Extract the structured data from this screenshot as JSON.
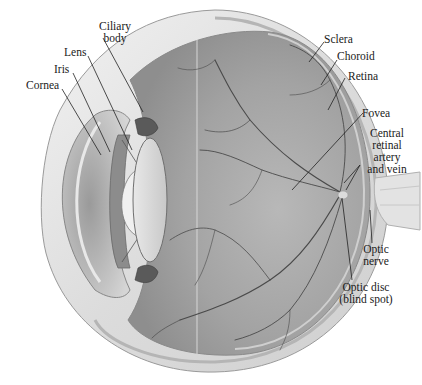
{
  "diagram": {
    "labels": {
      "ciliary_body": "Ciliary\nbody",
      "lens": "Lens",
      "iris": "Iris",
      "cornea": "Cornea",
      "sclera": "Sclera",
      "choroid": "Choroid",
      "retina": "Retina",
      "fovea": "Fovea",
      "central_retinal": "Central\nretinal\nartery\nand vein",
      "optic_nerve": "Optic\nnerve",
      "optic_disc": "Optic disc\n(blind spot)"
    },
    "colors": {
      "background": "#ffffff",
      "sclera": "#e6e6e6",
      "interior": "#a9a9a9",
      "vessels": "#4a4a4a",
      "leader_lines": "#222222",
      "text": "#1a1a1a"
    }
  }
}
